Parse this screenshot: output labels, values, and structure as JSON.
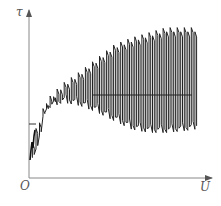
{
  "figure": {
    "y_axis_label": "τ",
    "x_axis_label": "U",
    "origin_label": "O",
    "colors": {
      "axis": "#777777",
      "curve": "#222222",
      "background": "#ffffff"
    }
  },
  "chart_data": {
    "type": "line",
    "title": "",
    "xlabel": "U",
    "ylabel": "τ",
    "series": [
      {
        "name": "upper envelope",
        "x": [
          0.02,
          0.1,
          0.2,
          0.3,
          0.4,
          0.5,
          0.6,
          0.7,
          0.8,
          0.9,
          0.97
        ],
        "values": [
          0.22,
          0.45,
          0.55,
          0.62,
          0.7,
          0.78,
          0.82,
          0.85,
          0.88,
          0.88,
          0.88
        ]
      },
      {
        "name": "lower envelope",
        "x": [
          0.02,
          0.1,
          0.2,
          0.3,
          0.4,
          0.5,
          0.6,
          0.7,
          0.8,
          0.9,
          0.97
        ],
        "values": [
          0.1,
          0.42,
          0.46,
          0.44,
          0.4,
          0.35,
          0.3,
          0.28,
          0.28,
          0.29,
          0.3
        ]
      },
      {
        "name": "mean level",
        "x": [
          0.35,
          0.97
        ],
        "values": [
          0.5,
          0.5
        ]
      }
    ],
    "grid": false,
    "legend": null
  }
}
